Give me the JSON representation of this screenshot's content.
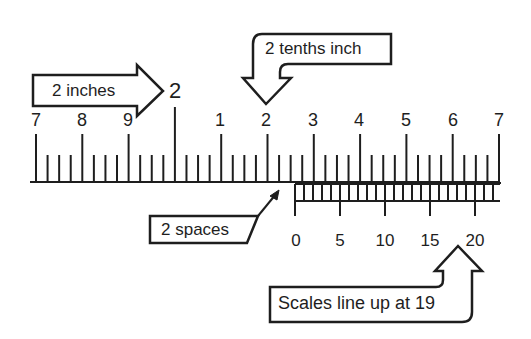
{
  "diagram": {
    "colors": {
      "ink": "#1e1e1e",
      "background": "#ffffff"
    },
    "main_scale": {
      "inch_label": "2",
      "labels": [
        "7",
        "8",
        "9",
        "1",
        "2",
        "3",
        "4",
        "5",
        "6",
        "7"
      ],
      "subdivisions_per_major": 4
    },
    "vernier_scale": {
      "labels": [
        "0",
        "5",
        "10",
        "15",
        "20"
      ],
      "divisions": 22
    },
    "callouts": {
      "inches": "2 inches",
      "tenths": "2 tenths inch",
      "spaces": "2 spaces",
      "lineup": "Scales line up at 19"
    }
  }
}
